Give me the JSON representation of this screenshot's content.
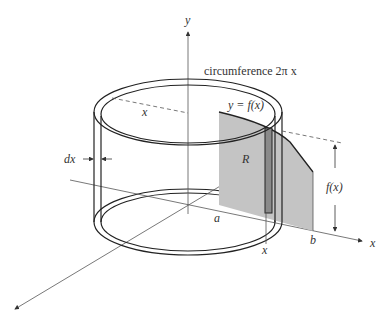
{
  "figure": {
    "colors": {
      "region_fill": "#c4c4c4",
      "strip_fill": "#8a8a8a",
      "line": "#222222",
      "axis": "#555555"
    },
    "labels": {
      "y_axis": "y",
      "x_axis": "x",
      "circumference": "circumference 2π x",
      "curve": "y = f(x)",
      "radius": "x",
      "thickness": "dx",
      "region": "R",
      "a": "a",
      "b": "b",
      "x_tick": "x",
      "height": "f(x)"
    }
  }
}
